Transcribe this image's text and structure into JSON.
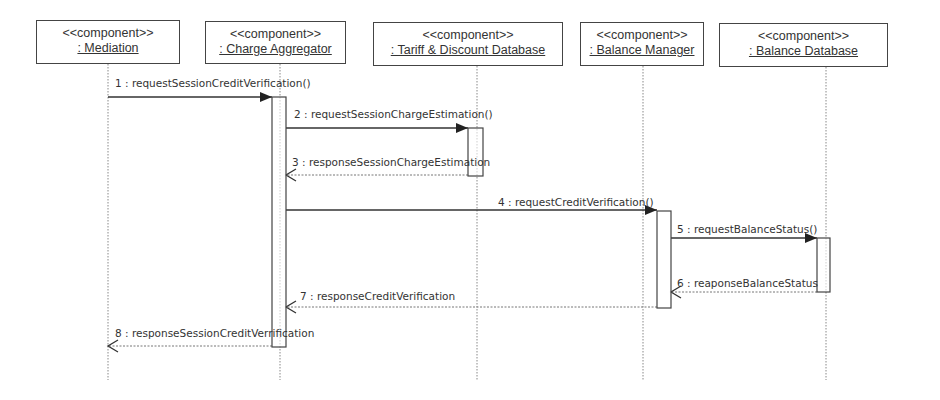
{
  "diagram": {
    "type": "UML sequence diagram",
    "participants": [
      {
        "id": "mediation",
        "stereotype": "<<component>>",
        "name": ": Mediation",
        "x": 108,
        "box": [
          36,
          20,
          144,
          44
        ]
      },
      {
        "id": "charge_aggregator",
        "stereotype": "<<component>>",
        "name": ": Charge Aggregator",
        "x": 280,
        "box": [
          205,
          21,
          141,
          43
        ]
      },
      {
        "id": "tariff_db",
        "stereotype": "<<component>>",
        "name": ": Tariff & Discount Database",
        "x": 477,
        "box": [
          373,
          22,
          190,
          44
        ]
      },
      {
        "id": "balance_manager",
        "stereotype": "<<component>>",
        "name": ": Balance Manager",
        "x": 643,
        "box": [
          580,
          22,
          124,
          44
        ]
      },
      {
        "id": "balance_db",
        "stereotype": "<<component>>",
        "name": ": Balance Database",
        "x": 826,
        "box": [
          719,
          23,
          169,
          44
        ]
      }
    ],
    "activations": [
      {
        "participant": "charge_aggregator",
        "x": 272,
        "y": 97,
        "w": 14,
        "h": 250
      },
      {
        "participant": "tariff_db",
        "x": 468,
        "y": 128,
        "w": 15,
        "h": 48
      },
      {
        "participant": "balance_manager",
        "x": 657,
        "y": 211,
        "w": 14,
        "h": 97
      },
      {
        "participant": "balance_db",
        "x": 817,
        "y": 238,
        "w": 13,
        "h": 54
      }
    ],
    "messages": [
      {
        "label": "1 : requestSessionCreditVerification()",
        "from": "mediation",
        "to": "charge_aggregator",
        "kind": "sync",
        "x1": 108,
        "x2": 272,
        "y": 97,
        "lx": 115,
        "ly": 87
      },
      {
        "label": "2 : requestSessionChargeEstimation()",
        "from": "charge_aggregator",
        "to": "tariff_db",
        "kind": "sync",
        "x1": 286,
        "x2": 468,
        "y": 128,
        "lx": 294,
        "ly": 118
      },
      {
        "label": "3 : responseSessionChargeEstimation",
        "from": "tariff_db",
        "to": "charge_aggregator",
        "kind": "return",
        "x1": 468,
        "x2": 286,
        "y": 175,
        "lx": 292,
        "ly": 166
      },
      {
        "label": "4 : requestCreditVerification()",
        "from": "charge_aggregator",
        "to": "balance_manager",
        "kind": "sync",
        "x1": 286,
        "x2": 657,
        "y": 210,
        "lx": 498,
        "ly": 206
      },
      {
        "label": "5 : requestBalanceStatus()",
        "from": "balance_manager",
        "to": "balance_db",
        "kind": "sync",
        "x1": 671,
        "x2": 817,
        "y": 238,
        "lx": 677,
        "ly": 233
      },
      {
        "label": "6 : reaponseBalanceStatus",
        "from": "balance_db",
        "to": "balance_manager",
        "kind": "return",
        "x1": 817,
        "x2": 671,
        "y": 292,
        "lx": 677,
        "ly": 287
      },
      {
        "label": "7 : responseCreditVerification",
        "from": "balance_manager",
        "to": "charge_aggregator",
        "kind": "return",
        "x1": 657,
        "x2": 286,
        "y": 307,
        "lx": 300,
        "ly": 300
      },
      {
        "label": "8 : responseSessionCreditVerrification",
        "from": "charge_aggregator",
        "to": "mediation",
        "kind": "return",
        "x1": 272,
        "x2": 108,
        "y": 346,
        "lx": 115,
        "ly": 337
      }
    ],
    "lifeline_bottom": 380
  }
}
